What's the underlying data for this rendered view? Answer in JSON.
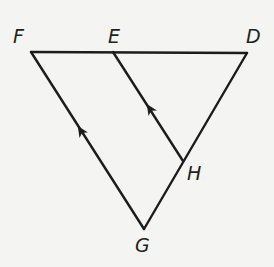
{
  "diagram": {
    "points": {
      "F": {
        "label": "F",
        "x": 31,
        "y": 52
      },
      "E": {
        "label": "E",
        "x": 113,
        "y": 52
      },
      "D": {
        "label": "D",
        "x": 247,
        "y": 53
      },
      "H": {
        "label": "H",
        "x": 183,
        "y": 161
      },
      "G": {
        "label": "G",
        "x": 144,
        "y": 229
      }
    },
    "segments": [
      "FD",
      "FG",
      "DG",
      "EH"
    ],
    "parallel_marks": [
      "FG",
      "EH"
    ],
    "colors": {
      "line": "#1c1c1c",
      "background": "#f4f4f2"
    }
  }
}
